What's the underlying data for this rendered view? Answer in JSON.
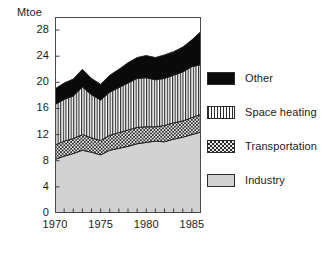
{
  "figure": {
    "unit_label": "Mtoe",
    "width": 327,
    "height": 254
  },
  "legend": {
    "position": "right",
    "items": [
      {
        "label": "Other",
        "key": "other",
        "swatch": "solid-black-swatch",
        "color": "#0a0a0a"
      },
      {
        "label": "Space heating",
        "key": "space_heating",
        "swatch": "vertical-lines-swatch",
        "color": "#2b2b2b"
      },
      {
        "label": "Transportation",
        "key": "transportation",
        "swatch": "checkerboard-swatch",
        "color": "#2b2b2b"
      },
      {
        "label": "Industry",
        "key": "industry",
        "swatch": "light-gray-swatch",
        "color": "#d2d2d2"
      }
    ]
  },
  "chart_data": {
    "type": "area",
    "stacked": true,
    "title": "",
    "subtitle": "",
    "xlabel": "",
    "ylabel": "Mtoe",
    "xlim": [
      1970,
      1986
    ],
    "ylim": [
      0,
      30
    ],
    "grid": false,
    "legend_position": "right",
    "y_ticks": [
      0,
      4,
      8,
      12,
      16,
      20,
      24,
      28
    ],
    "y_tick_labels": [
      "0",
      "4",
      "8",
      "12",
      "16",
      "20",
      "24",
      "28"
    ],
    "x_ticks": [
      1970,
      1971,
      1972,
      1973,
      1974,
      1975,
      1976,
      1977,
      1978,
      1979,
      1980,
      1981,
      1982,
      1983,
      1984,
      1985,
      1986
    ],
    "x_tick_labels_shown": [
      "1970",
      "1975",
      "1980",
      "1985"
    ],
    "x_labeled_ticks": [
      1970,
      1975,
      1980,
      1985
    ],
    "x": [
      1970,
      1971,
      1972,
      1973,
      1974,
      1975,
      1976,
      1977,
      1978,
      1979,
      1980,
      1981,
      1982,
      1983,
      1984,
      1985,
      1986
    ],
    "categories": [
      1970,
      1971,
      1972,
      1973,
      1974,
      1975,
      1976,
      1977,
      1978,
      1979,
      1980,
      1981,
      1982,
      1983,
      1984,
      1985,
      1986
    ],
    "series": [
      {
        "name": "Industry",
        "key": "industry",
        "stack_order": 1,
        "values": [
          8.2,
          8.7,
          9.1,
          9.6,
          9.3,
          8.9,
          9.6,
          9.9,
          10.2,
          10.6,
          10.8,
          11.0,
          10.9,
          11.3,
          11.6,
          12.0,
          12.4
        ]
      },
      {
        "name": "Transportation",
        "key": "transportation",
        "stack_order": 2,
        "values": [
          2.2,
          2.3,
          2.3,
          2.4,
          2.2,
          2.2,
          2.3,
          2.4,
          2.5,
          2.5,
          2.4,
          2.2,
          2.5,
          2.5,
          2.5,
          2.6,
          2.7
        ]
      },
      {
        "name": "Space heating",
        "key": "space_heating",
        "stack_order": 3,
        "values": [
          6.2,
          6.4,
          6.5,
          7.3,
          6.6,
          6.2,
          6.6,
          6.9,
          7.2,
          7.5,
          7.5,
          7.2,
          7.2,
          7.3,
          7.5,
          7.8,
          7.6
        ]
      },
      {
        "name": "Other",
        "key": "other",
        "stack_order": 4,
        "values": [
          2.4,
          2.5,
          2.6,
          2.7,
          2.5,
          2.4,
          2.6,
          2.8,
          3.1,
          3.2,
          3.4,
          3.4,
          3.6,
          3.6,
          3.8,
          4.1,
          5.1
        ]
      }
    ],
    "stacked_totals": [
      19.0,
      19.9,
      20.5,
      22.0,
      20.6,
      19.7,
      21.1,
      22.0,
      23.0,
      23.8,
      24.1,
      23.8,
      24.2,
      24.7,
      25.4,
      26.5,
      27.8
    ]
  }
}
